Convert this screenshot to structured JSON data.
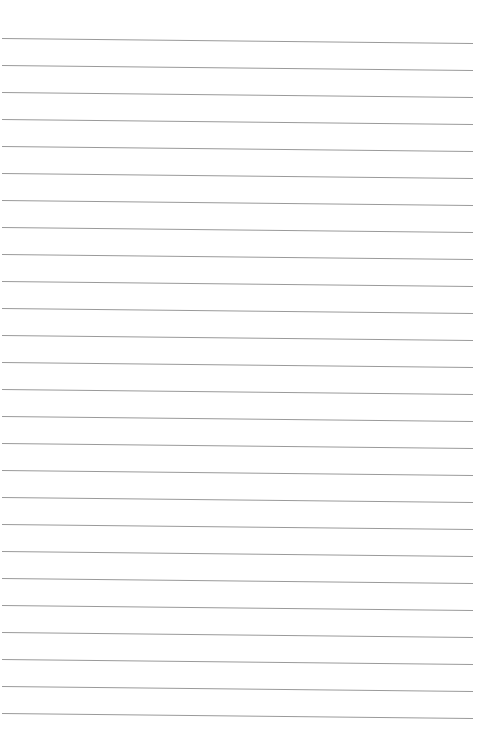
{
  "page": {
    "type": "lined-paper",
    "background": "#ffffff",
    "line_color": "#9a9a9a",
    "line_count": 26,
    "first_line_y_left": 38,
    "first_line_y_right": 43,
    "line_spacing": 27,
    "line_x_start": 2,
    "line_x_end": 473
  }
}
